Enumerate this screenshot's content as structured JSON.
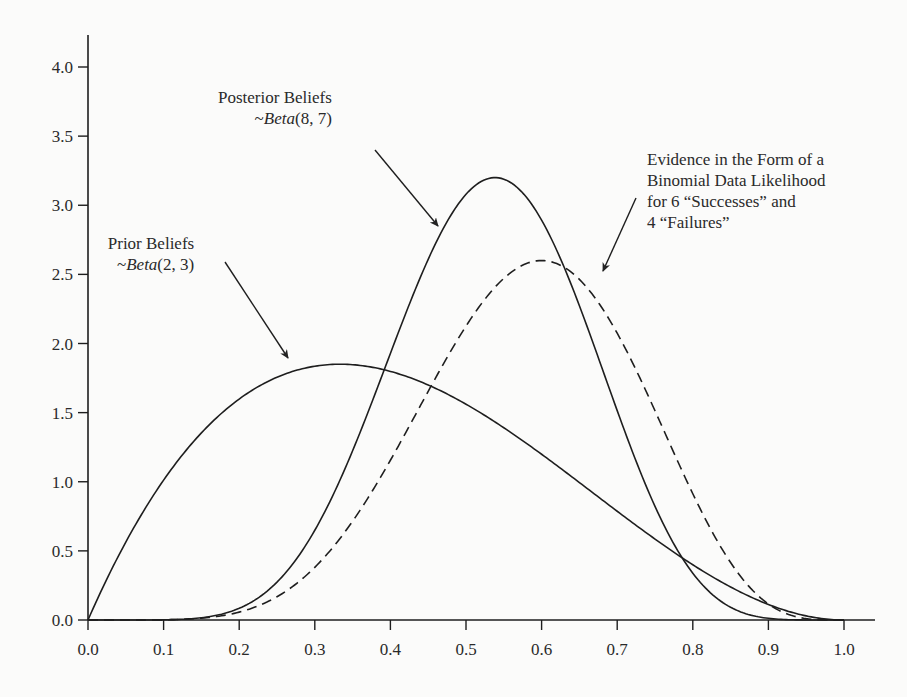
{
  "chart_data": {
    "type": "line",
    "title": "",
    "xlabel": "",
    "ylabel": "",
    "xlim": [
      0.0,
      1.0
    ],
    "ylim": [
      0.0,
      4.0
    ],
    "grid": false,
    "legend": "none (inline annotations)",
    "x_ticks": [
      "0.0",
      "0.1",
      "0.2",
      "0.3",
      "0.4",
      "0.5",
      "0.6",
      "0.7",
      "0.8",
      "0.9",
      "1.0"
    ],
    "y_ticks": [
      "0.0",
      "0.5",
      "1.0",
      "1.5",
      "2.0",
      "2.5",
      "3.0",
      "3.5",
      "4.0"
    ],
    "series": [
      {
        "name": "Prior Beliefs ~Beta(2, 3)",
        "style": "solid",
        "a": 2,
        "b": 3,
        "peak_x": 0.33,
        "peak_y": 1.85,
        "x": [
          0.0,
          0.05,
          0.1,
          0.15,
          0.2,
          0.25,
          0.3,
          0.35,
          0.4,
          0.45,
          0.5,
          0.55,
          0.6,
          0.65,
          0.7,
          0.75,
          0.8,
          0.85,
          0.9,
          0.95,
          1.0
        ],
        "values": [
          0.0,
          0.63,
          1.13,
          1.51,
          1.78,
          1.82,
          1.83,
          1.84,
          1.8,
          1.69,
          1.56,
          1.39,
          1.21,
          1.01,
          0.81,
          0.61,
          0.43,
          0.26,
          0.13,
          0.04,
          0.0
        ]
      },
      {
        "name": "Posterior Beliefs ~Beta(8, 7)",
        "style": "solid",
        "a": 8,
        "b": 7,
        "peak_x": 0.55,
        "peak_y": 3.2,
        "x": [
          0.0,
          0.1,
          0.15,
          0.2,
          0.25,
          0.3,
          0.35,
          0.4,
          0.45,
          0.5,
          0.55,
          0.6,
          0.65,
          0.7,
          0.75,
          0.8,
          0.85,
          0.9,
          0.95,
          1.0
        ],
        "values": [
          0.0,
          0.0,
          0.01,
          0.08,
          0.28,
          0.66,
          1.24,
          1.93,
          2.6,
          3.05,
          3.2,
          3.0,
          2.5,
          1.8,
          1.1,
          0.52,
          0.18,
          0.03,
          0.0,
          0.0
        ]
      },
      {
        "name": "Evidence: Binomial Data Likelihood (6 successes, 4 failures)",
        "style": "dashed",
        "a": 7,
        "b": 5,
        "peak_x": 0.62,
        "peak_y": 2.6,
        "x": [
          0.0,
          0.1,
          0.15,
          0.2,
          0.25,
          0.3,
          0.35,
          0.4,
          0.45,
          0.5,
          0.55,
          0.6,
          0.65,
          0.7,
          0.75,
          0.8,
          0.85,
          0.9,
          0.95,
          1.0
        ],
        "values": [
          0.0,
          0.0,
          0.01,
          0.04,
          0.14,
          0.34,
          0.66,
          1.08,
          1.55,
          2.01,
          2.38,
          2.58,
          2.56,
          2.28,
          1.76,
          1.14,
          0.56,
          0.18,
          0.02,
          0.0
        ]
      }
    ],
    "annotations": [
      {
        "id": "prior",
        "lines": [
          "Prior Beliefs"
        ],
        "dist_prefix": "~",
        "dist_name": "Beta",
        "dist_params": "(2, 3)",
        "arrow_to": [
          0.27,
          1.88
        ]
      },
      {
        "id": "posterior",
        "lines": [
          "Posterior Beliefs"
        ],
        "dist_prefix": "~",
        "dist_name": "Beta",
        "dist_params": "(8, 7)",
        "arrow_to": [
          0.47,
          2.85
        ]
      },
      {
        "id": "evidence",
        "lines": [
          "Evidence in the Form of a",
          "Binomial Data Likelihood",
          "for 6 “Successes” and",
          "4 “Failures”"
        ],
        "arrow_to": [
          0.68,
          2.52
        ]
      }
    ]
  },
  "annotations": {
    "prior": {
      "line1": "Prior Beliefs",
      "prefix": "~",
      "dist": "Beta",
      "params": "(2, 3)"
    },
    "posterior": {
      "line1": "Posterior Beliefs",
      "prefix": "~",
      "dist": "Beta",
      "params": "(8, 7)"
    },
    "evidence": {
      "line1": "Evidence in the Form of a",
      "line2": "Binomial Data Likelihood",
      "line3": "for 6 “Successes” and",
      "line4": "4 “Failures”"
    }
  }
}
